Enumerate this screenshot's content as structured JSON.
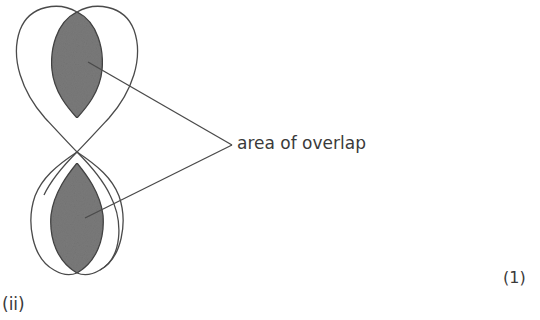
{
  "diagram": {
    "title": "",
    "annotation_label": "area of overlap",
    "mark": "(1)",
    "part": "(ii)",
    "colors": {
      "stroke": "#4a4a4a",
      "overlap_fill": "#7a7a7a",
      "background": "#ffffff"
    },
    "shapes": [
      {
        "name": "left-loop-curve"
      },
      {
        "name": "right-loop-curve"
      },
      {
        "name": "top-overlap-region"
      },
      {
        "name": "bottom-overlap-region"
      }
    ]
  }
}
